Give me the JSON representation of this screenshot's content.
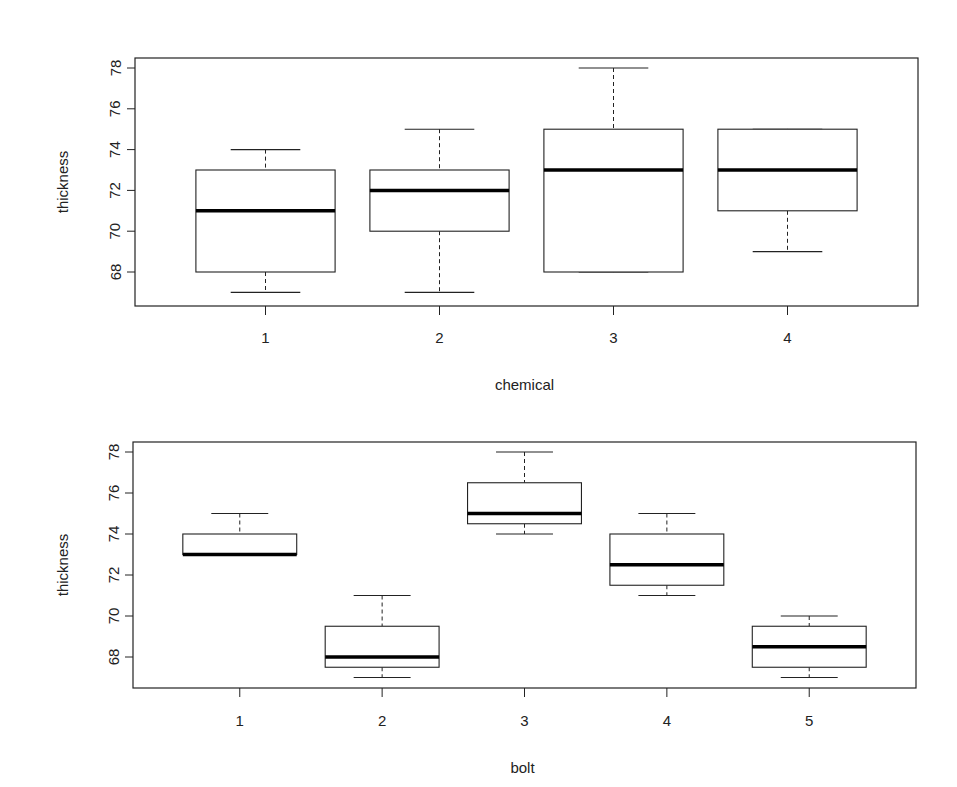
{
  "chart_data": [
    {
      "type": "box",
      "title": "",
      "xlabel": "chemical",
      "ylabel": "thickness",
      "categories": [
        "1",
        "2",
        "3",
        "4"
      ],
      "yticks": [
        68,
        70,
        72,
        74,
        76,
        78
      ],
      "ylim": [
        66.6,
        78.5
      ],
      "grid": false,
      "boxes": [
        {
          "category": "1",
          "min": 67,
          "q1": 68,
          "median": 71,
          "q3": 73,
          "max": 74
        },
        {
          "category": "2",
          "min": 67,
          "q1": 70,
          "median": 72,
          "q3": 73,
          "max": 75
        },
        {
          "category": "3",
          "min": 68,
          "q1": 68,
          "median": 73,
          "q3": 75,
          "max": 78
        },
        {
          "category": "4",
          "min": 69,
          "q1": 71,
          "median": 73,
          "q3": 75,
          "max": 75
        }
      ]
    },
    {
      "type": "box",
      "title": "",
      "xlabel": "bolt",
      "ylabel": "thickness",
      "categories": [
        "1",
        "2",
        "3",
        "4",
        "5"
      ],
      "yticks": [
        68,
        70,
        72,
        74,
        76,
        78
      ],
      "ylim": [
        66.6,
        78.5
      ],
      "grid": false,
      "boxes": [
        {
          "category": "1",
          "min": 73,
          "q1": 73,
          "median": 73,
          "q3": 74,
          "max": 75
        },
        {
          "category": "2",
          "min": 67,
          "q1": 67.5,
          "median": 68,
          "q3": 69.5,
          "max": 71
        },
        {
          "category": "3",
          "min": 74,
          "q1": 74.5,
          "median": 75,
          "q3": 76.5,
          "max": 78
        },
        {
          "category": "4",
          "min": 71,
          "q1": 71.5,
          "median": 72.5,
          "q3": 74,
          "max": 75
        },
        {
          "category": "5",
          "min": 67,
          "q1": 67.5,
          "median": 68.5,
          "q3": 69.5,
          "max": 70
        }
      ]
    }
  ],
  "colors": {
    "line": "#222222",
    "background": "#ffffff"
  }
}
